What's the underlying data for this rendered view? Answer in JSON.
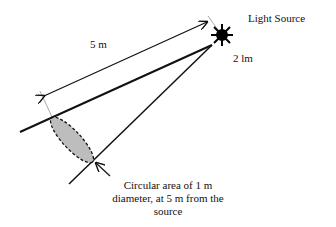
{
  "diagram": {
    "source_label": "Light Source",
    "flux_label": "2 lm",
    "distance_label": "5 m",
    "caption_lines": [
      "Circular area of 1 m",
      "diameter, at 5 m from the",
      "source"
    ],
    "colors": {
      "line": "#111111",
      "ellipse_fill": "#bdbdbd",
      "dimension_guide": "#aaaaaa"
    }
  }
}
